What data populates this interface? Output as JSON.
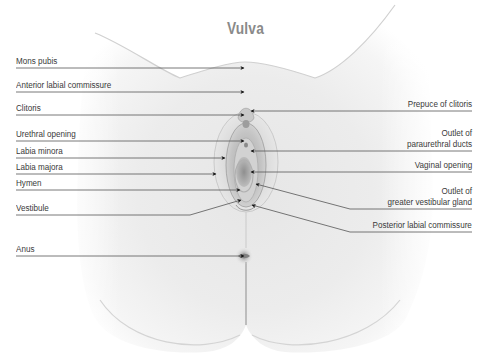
{
  "title": "Vulva",
  "labels": {
    "left": [
      {
        "text": "Mons pubis"
      },
      {
        "text": "Anterior labial commissure"
      },
      {
        "text": "Clitoris"
      },
      {
        "text": "Urethral opening"
      },
      {
        "text": "Labia minora"
      },
      {
        "text": "Labia majora"
      },
      {
        "text": "Hymen"
      },
      {
        "text": "Vestibule"
      },
      {
        "text": "Anus"
      }
    ],
    "right": [
      {
        "line1": "Prepuce of clitoris"
      },
      {
        "line1": "Outlet of",
        "line2": "paraurethral ducts"
      },
      {
        "line1": "Vaginal opening"
      },
      {
        "line1": "Outlet of",
        "line2": "greater vestibular gland"
      },
      {
        "line1": "Posterior labial commissure"
      }
    ]
  },
  "colors": {
    "title": "#8a8a8a",
    "label_text": "#3a3a3a",
    "leader_line": "#555555",
    "arrowhead": "#111111",
    "skin_light": "#f4f4f4",
    "skin_shadow": "#c8c8c8"
  }
}
